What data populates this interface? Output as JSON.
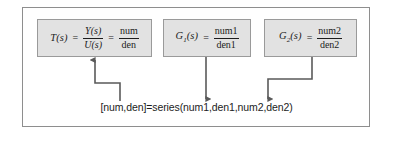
{
  "diagram": {
    "title_text": "Series connection block diagram",
    "frame": {
      "border_color": "#8e8e8e",
      "background_color": "#ffffff"
    },
    "box_style": {
      "fill_color": "#e2e2e2",
      "border_color": "#9a9a9a"
    },
    "arrow_color": "#5a5a5a",
    "text_color": "#1c1c1c",
    "boxes": [
      {
        "id": "transfer-function",
        "lhs": "T(s)",
        "lhs_base": "T",
        "lhs_sub": "",
        "lhs_arg": "(s)",
        "equals": "=",
        "fraction_1": {
          "numerator": "Y(s)",
          "denominator": "U(s)"
        },
        "equals_2": "=",
        "fraction_2": {
          "numerator": "num",
          "denominator": "den"
        }
      },
      {
        "id": "g1",
        "lhs_base": "G",
        "lhs_sub": "1",
        "lhs_arg": "(s)",
        "equals": "=",
        "fraction": {
          "numerator": "num1",
          "denominator": "den1"
        }
      },
      {
        "id": "g2",
        "lhs_base": "G",
        "lhs_sub": "2",
        "lhs_arg": "(s)",
        "equals": "=",
        "fraction": {
          "numerator": "num2",
          "denominator": "den2"
        }
      }
    ],
    "caption": "[num,den]=series(num1,den1,num2,den2)"
  }
}
